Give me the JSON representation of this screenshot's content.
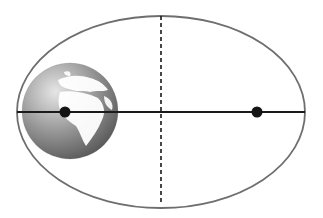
{
  "diagram": {
    "type": "elliptical-orbit",
    "colors": {
      "background": "#ffffff",
      "ellipse_stroke": "#6e6e6e",
      "major_axis": "#1a1a1a",
      "minor_axis_dashed": "#1a1a1a",
      "focus_point": "#141414",
      "globe_ocean_light": "#d8d8d8",
      "globe_ocean_dark": "#5a5a5a",
      "globe_land": "#ffffff"
    },
    "ellipse": {
      "cx": 161,
      "cy": 112,
      "rx": 144,
      "ry": 96
    },
    "major_axis": {
      "x1": 17,
      "x2": 305,
      "y": 112
    },
    "minor_axis": {
      "x": 161,
      "y1": 15,
      "y2": 204,
      "style": "dashed"
    },
    "foci": [
      {
        "name": "left-focus",
        "x": 65,
        "y": 112,
        "r": 5
      },
      {
        "name": "right-focus",
        "x": 257,
        "y": 112,
        "r": 5
      }
    ],
    "globe": {
      "label": "Earth",
      "cx": 70,
      "cy": 111,
      "r": 48
    }
  }
}
